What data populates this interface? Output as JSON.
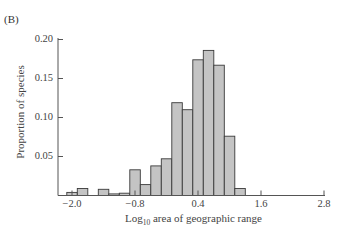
{
  "panel_label": "(B)",
  "chart_data": {
    "type": "bar",
    "title": "",
    "panel": "(B)",
    "xlabel": "Log10 area of geographic range",
    "xlabel_parts": {
      "base": "Log",
      "sub": "10",
      "rest": " area of geographic range"
    },
    "ylabel": "Proportion of species",
    "bin_width": 0.2,
    "bin_left_edges": [
      -2.1,
      -1.9,
      -1.7,
      -1.5,
      -1.3,
      -1.1,
      -0.9,
      -0.7,
      -0.5,
      -0.3,
      -0.1,
      0.1,
      0.3,
      0.5,
      0.7,
      0.9,
      1.1
    ],
    "values": [
      0.004,
      0.009,
      0.0,
      0.008,
      0.002,
      0.003,
      0.033,
      0.014,
      0.038,
      0.047,
      0.119,
      0.11,
      0.174,
      0.186,
      0.167,
      0.076,
      0.009
    ],
    "xlim": [
      -2.1,
      2.8
    ],
    "ylim": [
      0,
      0.2
    ],
    "xticks": [
      -2.0,
      -0.8,
      0.4,
      1.6,
      2.8
    ],
    "xtick_labels": [
      "−2.0",
      "−0.8",
      "0.4",
      "1.6",
      "2.8"
    ],
    "yticks": [
      0.05,
      0.1,
      0.15,
      0.2
    ],
    "ytick_labels": [
      "0.05",
      "0.10",
      "0.15",
      "0.20"
    ],
    "grid": false,
    "legend": null,
    "bar_color": "#c4c4c4",
    "bar_edge_color": "#3a3a3a"
  }
}
